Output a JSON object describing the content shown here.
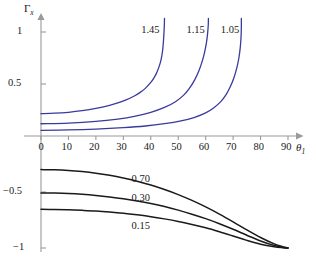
{
  "chart_data": {
    "type": "line",
    "title": "",
    "subtitle": "",
    "xlabel": "θ₁",
    "ylabel": "Γₓ",
    "xlim": [
      -4,
      96
    ],
    "ylim": [
      -1.08,
      1.14
    ],
    "grid": false,
    "legend": "inline-curve-labels",
    "x_ticks": [
      0,
      10,
      20,
      30,
      40,
      50,
      60,
      70,
      80,
      90
    ],
    "x_tick_labels": [
      "0",
      "10",
      "20",
      "30",
      "40",
      "50",
      "60",
      "70",
      "80",
      "90"
    ],
    "y_ticks": [
      1,
      0.5,
      -0.5,
      -1
    ],
    "y_tick_labels": [
      "1",
      "0.5",
      "-0.5",
      "-1"
    ],
    "series": [
      {
        "name": "1.45",
        "label": "1.45",
        "color": "#3a3a9c",
        "group": "upper-blue",
        "asymptote_x": 45,
        "points": [
          [
            0,
            0.215
          ],
          [
            5,
            0.219
          ],
          [
            10,
            0.228
          ],
          [
            15,
            0.243
          ],
          [
            20,
            0.265
          ],
          [
            25,
            0.295
          ],
          [
            28,
            0.318
          ],
          [
            31,
            0.347
          ],
          [
            34,
            0.385
          ],
          [
            36,
            0.417
          ],
          [
            38,
            0.458
          ],
          [
            40,
            0.515
          ],
          [
            41,
            0.552
          ],
          [
            42,
            0.6
          ],
          [
            43,
            0.665
          ],
          [
            43.8,
            0.74
          ],
          [
            44.3,
            0.82
          ],
          [
            44.6,
            0.905
          ],
          [
            44.8,
            0.99
          ],
          [
            44.95,
            1.075
          ],
          [
            45,
            1.13
          ]
        ]
      },
      {
        "name": "1.15",
        "label": "1.15",
        "color": "#3a3a9c",
        "group": "upper-blue",
        "asymptote_x": 61,
        "points": [
          [
            0,
            0.118
          ],
          [
            10,
            0.124
          ],
          [
            20,
            0.14
          ],
          [
            28,
            0.163
          ],
          [
            34,
            0.189
          ],
          [
            40,
            0.228
          ],
          [
            45,
            0.275
          ],
          [
            49,
            0.33
          ],
          [
            52,
            0.393
          ],
          [
            54,
            0.455
          ],
          [
            56,
            0.54
          ],
          [
            57.5,
            0.625
          ],
          [
            58.7,
            0.715
          ],
          [
            59.6,
            0.805
          ],
          [
            60.3,
            0.9
          ],
          [
            60.7,
            0.985
          ],
          [
            60.95,
            1.07
          ],
          [
            61,
            1.13
          ]
        ]
      },
      {
        "name": "1.05",
        "label": "1.05",
        "color": "#3a3a9c",
        "group": "upper-blue",
        "asymptote_x": 73,
        "points": [
          [
            0,
            0.055
          ],
          [
            10,
            0.058
          ],
          [
            20,
            0.066
          ],
          [
            30,
            0.08
          ],
          [
            38,
            0.096
          ],
          [
            45,
            0.118
          ],
          [
            51,
            0.145
          ],
          [
            56,
            0.18
          ],
          [
            60,
            0.222
          ],
          [
            63,
            0.272
          ],
          [
            65.5,
            0.33
          ],
          [
            67.5,
            0.4
          ],
          [
            69,
            0.475
          ],
          [
            70.3,
            0.56
          ],
          [
            71.3,
            0.65
          ],
          [
            72.1,
            0.75
          ],
          [
            72.6,
            0.85
          ],
          [
            72.9,
            0.955
          ],
          [
            73,
            1.05
          ],
          [
            73,
            1.13
          ]
        ]
      },
      {
        "name": "0.70",
        "label": "0.70",
        "color": "#1a1a1a",
        "group": "lower-black",
        "points": [
          [
            0,
            -0.3
          ],
          [
            5,
            -0.302
          ],
          [
            10,
            -0.308
          ],
          [
            15,
            -0.318
          ],
          [
            20,
            -0.332
          ],
          [
            25,
            -0.351
          ],
          [
            30,
            -0.375
          ],
          [
            35,
            -0.404
          ],
          [
            40,
            -0.438
          ],
          [
            45,
            -0.478
          ],
          [
            50,
            -0.523
          ],
          [
            55,
            -0.575
          ],
          [
            60,
            -0.633
          ],
          [
            65,
            -0.697
          ],
          [
            70,
            -0.766
          ],
          [
            75,
            -0.838
          ],
          [
            80,
            -0.906
          ],
          [
            85,
            -0.963
          ],
          [
            88,
            -0.988
          ],
          [
            90,
            -1.0
          ]
        ]
      },
      {
        "name": "0.30",
        "label": "0.30",
        "color": "#1a1a1a",
        "group": "lower-black",
        "points": [
          [
            0,
            -0.508
          ],
          [
            5,
            -0.51
          ],
          [
            10,
            -0.514
          ],
          [
            15,
            -0.521
          ],
          [
            20,
            -0.531
          ],
          [
            25,
            -0.544
          ],
          [
            30,
            -0.56
          ],
          [
            35,
            -0.58
          ],
          [
            40,
            -0.603
          ],
          [
            45,
            -0.63
          ],
          [
            50,
            -0.662
          ],
          [
            55,
            -0.698
          ],
          [
            60,
            -0.738
          ],
          [
            65,
            -0.783
          ],
          [
            70,
            -0.833
          ],
          [
            75,
            -0.886
          ],
          [
            80,
            -0.937
          ],
          [
            85,
            -0.978
          ],
          [
            88,
            -0.994
          ],
          [
            90,
            -1.0
          ]
        ]
      },
      {
        "name": "0.15",
        "label": "0.15",
        "color": "#1a1a1a",
        "group": "lower-black",
        "points": [
          [
            0,
            -0.655
          ],
          [
            5,
            -0.656
          ],
          [
            10,
            -0.659
          ],
          [
            15,
            -0.664
          ],
          [
            20,
            -0.67
          ],
          [
            25,
            -0.679
          ],
          [
            30,
            -0.69
          ],
          [
            35,
            -0.704
          ],
          [
            40,
            -0.72
          ],
          [
            45,
            -0.74
          ],
          [
            50,
            -0.763
          ],
          [
            55,
            -0.79
          ],
          [
            60,
            -0.82
          ],
          [
            65,
            -0.855
          ],
          [
            70,
            -0.893
          ],
          [
            75,
            -0.932
          ],
          [
            80,
            -0.966
          ],
          [
            85,
            -0.989
          ],
          [
            88,
            -0.997
          ],
          [
            90,
            -1.0
          ]
        ]
      }
    ],
    "curve_label_positions": [
      {
        "text": "1.45",
        "x": 36.5,
        "y": 1.01
      },
      {
        "text": "1.15",
        "x": 53.0,
        "y": 1.01
      },
      {
        "text": "1.05",
        "x": 65.5,
        "y": 1.01
      },
      {
        "text": "0.70",
        "x": 33.0,
        "y": -0.39
      },
      {
        "text": "0.30",
        "x": 33.0,
        "y": -0.565
      },
      {
        "text": "0.15",
        "x": 33.0,
        "y": -0.81
      }
    ],
    "colors": {
      "upper_curves": "#3a3a9c",
      "lower_curves": "#1a1a1a",
      "axis": "#9a9a9a",
      "text": "#1a1a1a",
      "background": "#ffffff"
    }
  },
  "figure": {
    "y_axis_label_main": "Γ",
    "y_axis_label_sub": "x",
    "x_axis_label_main": "θ",
    "x_axis_label_sub": "1",
    "y_tick_1": "1",
    "y_tick_05": "0.5",
    "y_tick_m05": "−0.5",
    "y_tick_m1": "−1",
    "x_tick_0": "0",
    "x_tick_10": "10",
    "x_tick_20": "20",
    "x_tick_30": "30",
    "x_tick_40": "40",
    "x_tick_50": "50",
    "x_tick_60": "60",
    "x_tick_70": "70",
    "x_tick_80": "80",
    "x_tick_90": "90",
    "label_145": "1.45",
    "label_115": "1.15",
    "label_105": "1.05",
    "label_070": "0.70",
    "label_030": "0.30",
    "label_015": "0.15"
  }
}
